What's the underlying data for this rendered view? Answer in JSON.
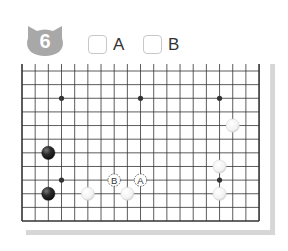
{
  "problem": {
    "number": "6",
    "badge_color": "#a8a8a8",
    "choices": [
      {
        "label": "A",
        "checked": false
      },
      {
        "label": "B",
        "checked": false
      }
    ]
  },
  "board": {
    "size": 19,
    "visible_rows": 12,
    "columns": 19,
    "top_edge_visible": false,
    "colors": {
      "line": "#333333",
      "black_stone": "#222222",
      "white_stone": "#ffffff",
      "shadow": "#d6d6d6"
    },
    "hoshi": [
      {
        "col": 3,
        "row": 2
      },
      {
        "col": 9,
        "row": 2
      },
      {
        "col": 15,
        "row": 2
      },
      {
        "col": 3,
        "row": 8
      },
      {
        "col": 15,
        "row": 8
      }
    ],
    "stones": [
      {
        "color": "white",
        "col": 16,
        "row": 4
      },
      {
        "color": "black",
        "col": 2,
        "row": 6
      },
      {
        "color": "black",
        "col": 2,
        "row": 9
      },
      {
        "color": "white",
        "col": 5,
        "row": 9
      },
      {
        "color": "white",
        "col": 8,
        "row": 9
      },
      {
        "color": "white",
        "col": 15,
        "row": 7
      },
      {
        "color": "white",
        "col": 15,
        "row": 9
      }
    ],
    "markers": [
      {
        "label": "B",
        "col": 7,
        "row": 8
      },
      {
        "label": "A",
        "col": 9,
        "row": 8
      }
    ]
  }
}
